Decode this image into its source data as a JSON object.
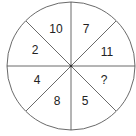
{
  "puzzle": {
    "type": "number-wheel",
    "segments": [
      {
        "position": "top-left",
        "value": "10"
      },
      {
        "position": "top-right",
        "value": "7"
      },
      {
        "position": "right-upper",
        "value": "11"
      },
      {
        "position": "right-lower",
        "value": "?"
      },
      {
        "position": "bottom-right",
        "value": "5"
      },
      {
        "position": "bottom-left",
        "value": "8"
      },
      {
        "position": "left-lower",
        "value": "4"
      },
      {
        "position": "left-upper",
        "value": "2"
      }
    ]
  },
  "colors": {
    "stroke": "#444444",
    "text": "#222222",
    "background": "#ffffff"
  }
}
